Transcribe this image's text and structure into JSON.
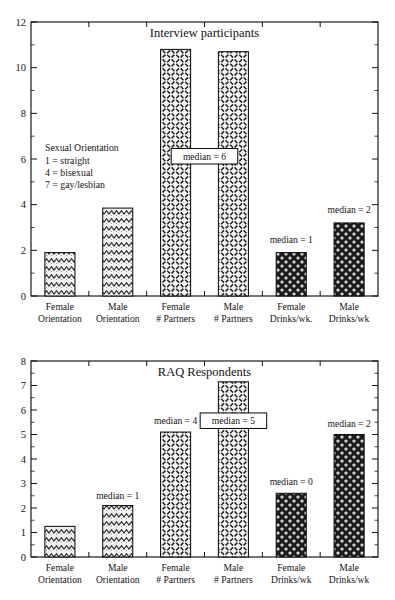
{
  "figure": {
    "background": "#ffffff",
    "ink_color": "#141414"
  },
  "chart_data": [
    {
      "type": "bar",
      "title": "Interview participants",
      "xlabel": "",
      "ylabel": "",
      "ylim": [
        0,
        12
      ],
      "ytick_step": 2,
      "yticks": [
        "0",
        "2",
        "4",
        "6",
        "8",
        "10",
        "12"
      ],
      "minor_ticks": true,
      "grid": false,
      "legend_position": "none",
      "categories": [
        "Female\nOrientation",
        "Male\nOrientation",
        "Female\n# Partners",
        "Male\n# Partners",
        "Female\nDrinks/wk.",
        "Male\nDrinks/wk"
      ],
      "category_lines": [
        [
          "Female",
          "Orientation"
        ],
        [
          "Male",
          "Orientation"
        ],
        [
          "Female",
          "# Partners"
        ],
        [
          "Male",
          "# Partners"
        ],
        [
          "Female",
          "Drinks/wk."
        ],
        [
          "Male",
          "Drinks/wk"
        ]
      ],
      "values": [
        1.9,
        3.85,
        10.8,
        10.7,
        1.9,
        3.2
      ],
      "fills": [
        "zigzag",
        "zigzag",
        "crosshatch",
        "crosshatch",
        "dots-dark",
        "dots-dark"
      ],
      "annotations": [
        {
          "label": "median = 6",
          "boxed": true,
          "bar_index": 2,
          "value_y": 6.0,
          "span_bars": [
            2,
            3
          ]
        },
        {
          "label": "median = 1",
          "boxed": false,
          "bar_index": 4,
          "value_y": 2.35
        },
        {
          "label": "median = 2",
          "boxed": false,
          "bar_index": 5,
          "value_y": 3.65
        }
      ],
      "legend_block": {
        "heading": "Sexual Orientation",
        "lines": [
          "1 = straight",
          "4 = bisexual",
          "7 = gay/lesbian"
        ]
      }
    },
    {
      "type": "bar",
      "title": "RAQ Respondents",
      "xlabel": "",
      "ylabel": "",
      "ylim": [
        0,
        8
      ],
      "ytick_step": 1,
      "yticks": [
        "0",
        "1",
        "2",
        "3",
        "4",
        "5",
        "6",
        "7",
        "8"
      ],
      "minor_ticks": true,
      "grid": false,
      "legend_position": "none",
      "categories": [
        "Female\nOrientation",
        "Male\nOrientation",
        "Female\n# Partners",
        "Male\n# Partners",
        "Female\nDrinks/wk",
        "Male\nDrinks/wk"
      ],
      "category_lines": [
        [
          "Female",
          "Orientation"
        ],
        [
          "Male",
          "Orientation"
        ],
        [
          "Female",
          "# Partners"
        ],
        [
          "Male",
          "# Partners"
        ],
        [
          "Female",
          "Drinks/wk"
        ],
        [
          "Male",
          "Drinks/wk"
        ]
      ],
      "values": [
        1.25,
        2.1,
        5.1,
        7.15,
        2.6,
        5.0
      ],
      "fills": [
        "zigzag",
        "zigzag",
        "crosshatch",
        "crosshatch",
        "dots-dark",
        "dots-dark"
      ],
      "annotations": [
        {
          "label": "median = 1",
          "boxed": false,
          "bar_index": 1,
          "value_y": 2.4
        },
        {
          "label": "median = 4",
          "boxed": false,
          "bar_index": 2,
          "value_y": 5.45
        },
        {
          "label": "median = 5",
          "boxed": true,
          "bar_index": 3,
          "value_y": 5.45
        },
        {
          "label": "median = 0",
          "boxed": false,
          "bar_index": 4,
          "value_y": 2.95
        },
        {
          "label": "median = 2",
          "boxed": false,
          "bar_index": 5,
          "value_y": 5.35
        }
      ],
      "legend_block": null
    }
  ]
}
